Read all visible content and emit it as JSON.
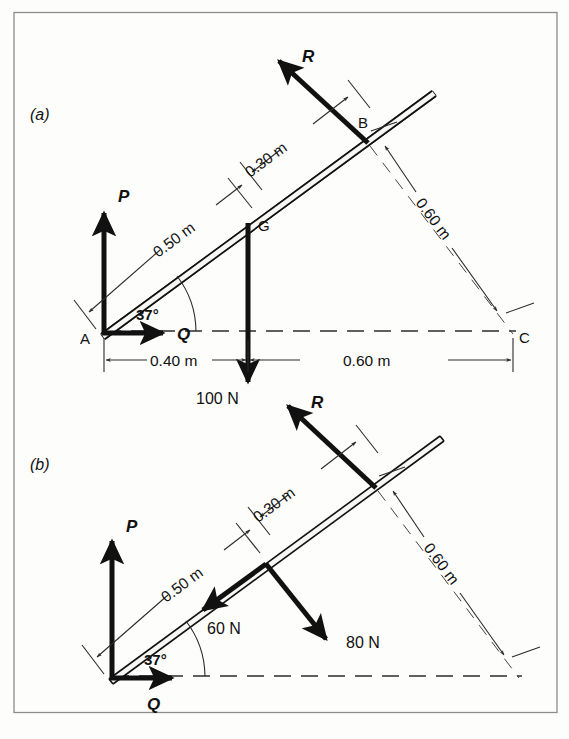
{
  "figure": {
    "caption_a": "(a)",
    "caption_b": "(b)"
  },
  "part_a": {
    "points": {
      "A": "A",
      "B": "B",
      "C": "C",
      "G": "G"
    },
    "forces": {
      "P": "P",
      "Q": "Q",
      "R": "R",
      "weight": "100 N"
    },
    "angle": "37°",
    "dimensions": {
      "along_rod_A_to_G": "0.50 m",
      "along_rod_G_to_B": "0.30 m",
      "perp_B_to_C": "0.60 m",
      "horizontal_A_to_G": "0.40 m",
      "horizontal_G_to_C": "0.60 m"
    }
  },
  "part_b": {
    "forces": {
      "P": "P",
      "Q": "Q",
      "R": "R",
      "component_along_rod": "60 N",
      "component_perp_rod": "80 N"
    },
    "angle": "37°",
    "dimensions": {
      "along_rod_A_to_G": "0.50 m",
      "along_rod_G_to_B": "0.30 m",
      "perp_B_to_C": "0.60 m"
    }
  },
  "colors": {
    "ink": "#111111",
    "thin_ink": "#2b2b2b",
    "frame": "#8c8c8c",
    "paper": "#fdfdfc"
  }
}
